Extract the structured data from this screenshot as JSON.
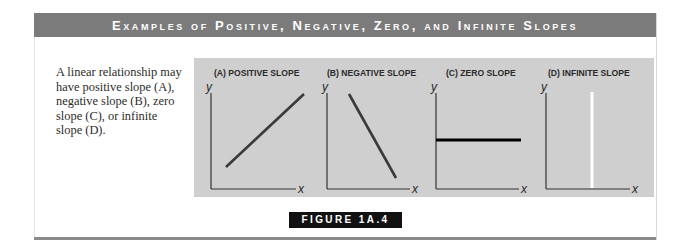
{
  "header": {
    "title": "Examples of Positive, Negative, Zero, and Infinite Slopes"
  },
  "caption": {
    "parts": [
      "A linear relationship may have positive slope (",
      "A",
      "), negative slope (",
      "B",
      "), zero slope (",
      "C",
      "), or infinite slope (",
      "D",
      ")."
    ]
  },
  "panels": [
    {
      "title": "(A) POSITIVE SLOPE",
      "y_label": "y",
      "x_label": "x",
      "slope": "positive",
      "line_color": "#3a3a3a"
    },
    {
      "title": "(B) NEGATIVE SLOPE",
      "y_label": "y",
      "x_label": "x",
      "slope": "negative",
      "line_color": "#3a3a3a"
    },
    {
      "title": "(C) ZERO SLOPE",
      "y_label": "y",
      "x_label": "x",
      "slope": "zero",
      "line_color": "#000000"
    },
    {
      "title": "(D) INFINITE SLOPE",
      "y_label": "y",
      "x_label": "x",
      "slope": "infinite",
      "line_color": "#ffffff"
    }
  ],
  "figure_label": "FIGURE 1A.4",
  "colors": {
    "header_bg": "#7b7b7b",
    "panel_bg": "#cfcfcf",
    "label_bg": "#111111"
  }
}
